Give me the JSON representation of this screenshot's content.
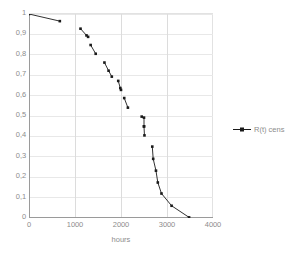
{
  "chart_data": {
    "type": "line",
    "title": "",
    "xlabel": "hours",
    "ylabel": "",
    "xlim": [
      0,
      4000
    ],
    "ylim": [
      0,
      1
    ],
    "grid": true,
    "legend_position": "right",
    "x_ticks": [
      "0",
      "1000",
      "2000",
      "3000",
      "4000"
    ],
    "x_tick_values": [
      0,
      1000,
      2000,
      3000,
      4000
    ],
    "y_ticks": [
      "0",
      "0,1",
      "0,2",
      "0,3",
      "0,4",
      "0,5",
      "0,6",
      "0,7",
      "0,8",
      "0,9",
      "1"
    ],
    "y_tick_values": [
      0,
      0.1,
      0.2,
      0.3,
      0.4,
      0.5,
      0.6,
      0.7,
      0.8,
      0.9,
      1
    ],
    "series": [
      {
        "name": "R(t) cens",
        "marker": "square",
        "color": "#1a1a1a",
        "segments": [
          {
            "x": [
              0,
              670
            ],
            "y": [
              1.0,
              0.965
            ]
          },
          {
            "x": [
              1120,
              1250,
              1285
            ],
            "y": [
              0.928,
              0.895,
              0.888
            ]
          },
          {
            "x": [
              1340,
              1450
            ],
            "y": [
              0.848,
              0.805
            ]
          },
          {
            "x": [
              1640,
              1730,
              1800
            ],
            "y": [
              0.762,
              0.722,
              0.693
            ]
          },
          {
            "x": [
              1940,
              1985,
              2000
            ],
            "y": [
              0.672,
              0.637,
              0.628
            ]
          },
          {
            "x": [
              2070,
              2150
            ],
            "y": [
              0.588,
              0.541
            ]
          },
          {
            "x": [
              2450,
              2500,
              2500
            ],
            "y": [
              0.497,
              0.492,
              0.449
            ]
          },
          {
            "x": [
              2500,
              2510
            ],
            "y": [
              0.449,
              0.405
            ]
          },
          {
            "x": [
              2680,
              2700,
              2760,
              2800,
              2880,
              3100,
              3480
            ],
            "y": [
              0.35,
              0.29,
              0.232,
              0.174,
              0.12,
              0.06,
              0.003
            ]
          }
        ]
      }
    ]
  },
  "legend": {
    "entries": [
      {
        "label": "R(t) cens"
      }
    ]
  },
  "axis": {
    "x_title": "hours"
  }
}
